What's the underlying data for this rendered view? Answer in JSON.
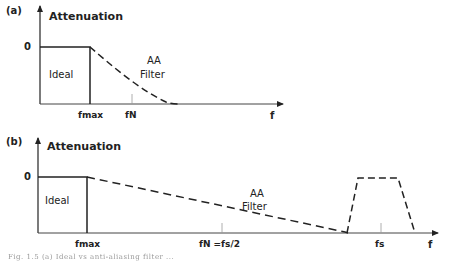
{
  "panels": [
    {
      "id": "a",
      "label": "(a)",
      "y_axis_label": "Attenuation",
      "zero_label": "0",
      "ideal_label": "Ideal",
      "filter_label_line1": "AA",
      "filter_label_line2": "Filter",
      "x_axis_label": "f",
      "ticks": [
        {
          "label": "fmax"
        },
        {
          "label": "fN"
        }
      ]
    },
    {
      "id": "b",
      "label": "(b)",
      "y_axis_label": "Attenuation",
      "zero_label": "0",
      "ideal_label": "Ideal",
      "filter_label_line1": "AA",
      "filter_label_line2": "Filter",
      "x_axis_label": "f",
      "ticks": [
        {
          "label": "fmax"
        },
        {
          "label": "fN =fs/2"
        },
        {
          "label": "fs"
        }
      ]
    }
  ],
  "caption": "Fig. 1.5  (a) Ideal vs anti-aliasing filter ...",
  "colors": {
    "axis": "#222222",
    "tick": "#999999",
    "dashed": "#222222"
  }
}
